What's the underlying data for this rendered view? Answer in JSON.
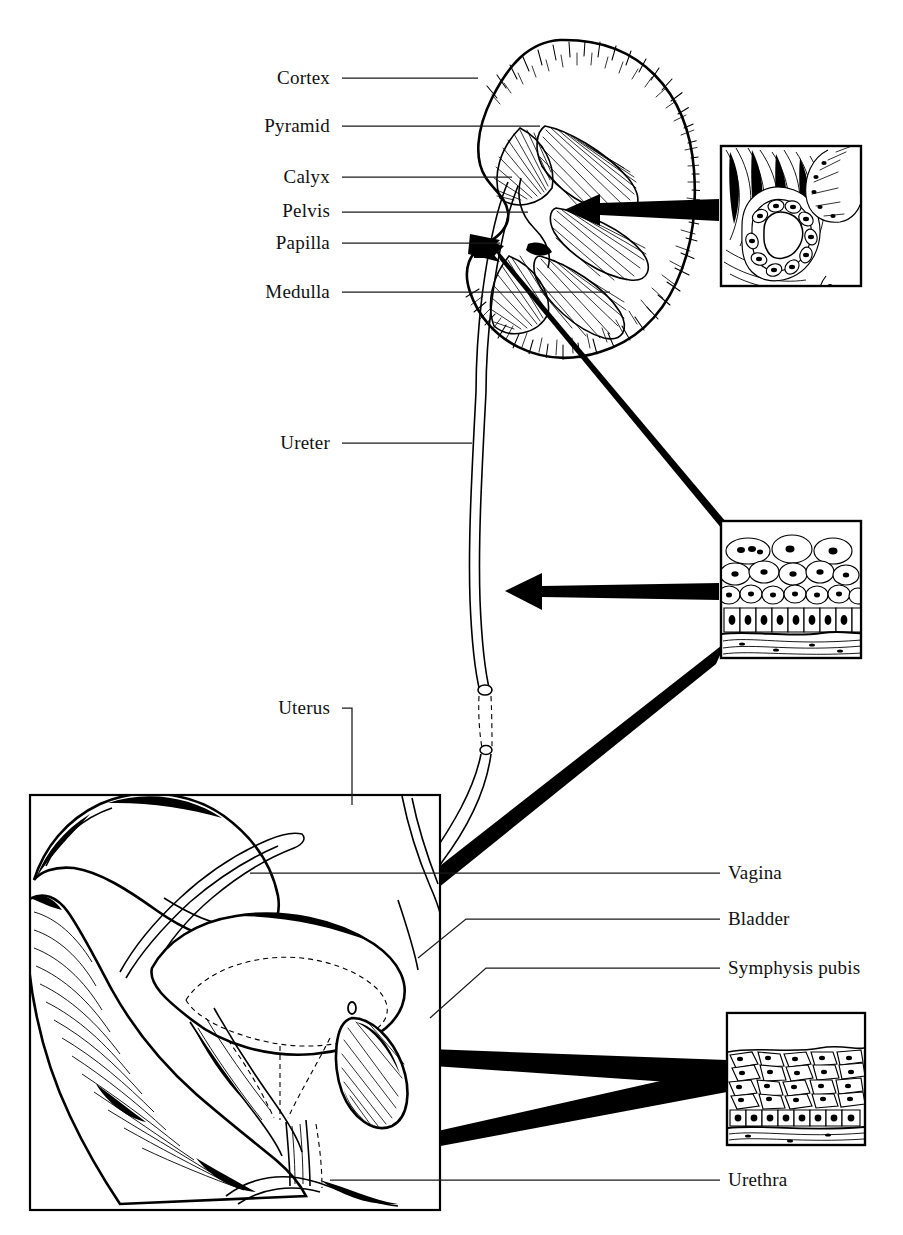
{
  "figure": {
    "background_color": "#ffffff",
    "ink_color": "#000000",
    "width": 903,
    "height": 1235
  },
  "labels": {
    "kidney": [
      {
        "id": "cortex",
        "text": "Cortex",
        "side": "left",
        "text_x": 330,
        "text_y": 84,
        "line_from_x": 342,
        "line_to_x": 478,
        "line_y": 78
      },
      {
        "id": "pyramid",
        "text": "Pyramid",
        "side": "left",
        "text_x": 330,
        "text_y": 132,
        "line_from_x": 342,
        "line_to_x": 540,
        "line_y": 126
      },
      {
        "id": "calyx",
        "text": "Calyx",
        "side": "left",
        "text_x": 330,
        "text_y": 183,
        "line_from_x": 342,
        "line_to_x": 512,
        "line_y": 177
      },
      {
        "id": "pelvis",
        "text": "Pelvis",
        "side": "left",
        "text_x": 330,
        "text_y": 217,
        "line_from_x": 342,
        "line_to_x": 528,
        "line_y": 212
      },
      {
        "id": "papilla",
        "text": "Papilla",
        "side": "left",
        "text_x": 330,
        "text_y": 249,
        "line_from_x": 342,
        "line_to_x": 500,
        "line_y": 243
      },
      {
        "id": "medulla",
        "text": "Medulla",
        "side": "left",
        "text_x": 330,
        "text_y": 298,
        "line_from_x": 342,
        "line_to_x": 610,
        "line_y": 292
      }
    ],
    "ureter": {
      "id": "ureter",
      "text": "Ureter",
      "side": "left",
      "text_x": 330,
      "text_y": 449,
      "line_from_x": 342,
      "line_to_x": 472,
      "line_y": 443
    },
    "uterus": {
      "id": "uterus",
      "text": "Uterus",
      "side": "left",
      "text_x": 330,
      "text_y": 714,
      "elbow_x": 352,
      "elbow_y": 708,
      "corner_x": 352,
      "drop_to_y": 805
    },
    "pelvis_right": [
      {
        "id": "vagina",
        "text": "Vagina",
        "side": "right",
        "text_x": 728,
        "text_y": 879,
        "line_from_x": 720,
        "line_to_x": 250,
        "line_y": 873,
        "elbow": false
      },
      {
        "id": "bladder",
        "text": "Bladder",
        "side": "right",
        "text_x": 728,
        "text_y": 925,
        "line_from_x": 720,
        "line_to_x": 466,
        "line_y": 919,
        "elbow": true,
        "elbow_to_x": 418,
        "elbow_to_y": 958
      },
      {
        "id": "symphysis_pubis",
        "text": "Symphysis pubis",
        "side": "right",
        "text_x": 728,
        "text_y": 974,
        "line_from_x": 720,
        "line_to_x": 486,
        "line_y": 968,
        "elbow": true,
        "elbow_to_x": 430,
        "elbow_to_y": 1018
      },
      {
        "id": "urethra",
        "text": "Urethra",
        "side": "right",
        "text_x": 728,
        "text_y": 1186,
        "line_from_x": 720,
        "line_to_x": 330,
        "line_y": 1180,
        "elbow": false
      }
    ]
  },
  "insets": [
    {
      "id": "papilla-histology",
      "name": "collecting-duct-histology-inset",
      "x": 721,
      "y": 146,
      "w": 140,
      "h": 140,
      "description": "Renal papilla: collecting duct lined by cuboidal epithelium"
    },
    {
      "id": "ureter-histology",
      "name": "transitional-epithelium-inset",
      "x": 721,
      "y": 521,
      "w": 140,
      "h": 137,
      "description": "Ureter: transitional epithelium (urothelium)"
    },
    {
      "id": "urethra-histology",
      "name": "stratified-epithelium-inset",
      "x": 727,
      "y": 1013,
      "w": 138,
      "h": 132,
      "description": "Urethra: stratified squamous epithelium"
    }
  ],
  "pelvic_panel": {
    "name": "pelvic-sagittal-panel",
    "x": 30,
    "y": 795,
    "w": 410,
    "h": 415,
    "description": "Mid-sagittal section of the female pelvis"
  },
  "kidney": {
    "name": "kidney-coronal-section",
    "center_x": 570,
    "center_y": 195,
    "description": "Coronal section of kidney showing cortex, medulla, pyramids, calyces, pelvis"
  },
  "connector_arrows": [
    {
      "id": "arrow-papilla",
      "from": "ureter-histology",
      "to": "papilla",
      "tip_x": 474,
      "tip_y": 238,
      "tail_x": 726,
      "tail_y": 530,
      "type": "tapered"
    },
    {
      "id": "arrow-calyx",
      "from": "papilla-histology",
      "to": "calyx-region",
      "tip_x": 592,
      "tip_y": 208,
      "tail_x": 719,
      "tail_y": 210,
      "type": "straight"
    },
    {
      "id": "arrow-ureter",
      "from": "ureter-histology",
      "to": "ureter",
      "tip_x": 474,
      "tip_y": 590,
      "tail_x": 719,
      "tail_y": 592,
      "type": "straight"
    },
    {
      "id": "arrow-bladder",
      "from": "ureter-histology",
      "to": "bladder",
      "tip_x": 338,
      "tip_y": 956,
      "tail_x": 724,
      "tail_y": 650,
      "type": "tapered"
    },
    {
      "id": "arrow-urethra-wall",
      "from": "urethra-histology",
      "to": "urethra-wall",
      "tip_x": 192,
      "tip_y": 1046,
      "tail_x": 726,
      "tail_y": 1072,
      "type": "tapered"
    },
    {
      "id": "arrow-urethra-orifice",
      "from": "urethra-histology",
      "to": "urethra-orifice",
      "tip_x": 342,
      "tip_y": 1158,
      "tail_x": 726,
      "tail_y": 1078,
      "type": "tapered"
    }
  ]
}
